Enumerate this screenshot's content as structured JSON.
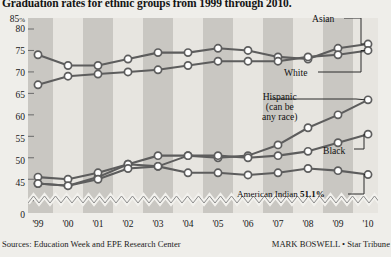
{
  "headline": "Graduation rates for ethnic groups from 1999 through 2010.",
  "footer": {
    "sources": "Sources: Education Week and EPE Research Center",
    "credit": "MARK BOSWELL • Star Tribune"
  },
  "axis": {
    "y_top_label": "85",
    "y_top_suffix": "%",
    "y_ticks": [
      "85",
      "80",
      "75",
      "70",
      "65",
      "60",
      "55",
      "50",
      "45",
      "0"
    ],
    "x_ticks": [
      "'99",
      "'00",
      "'01",
      "'02",
      "'03",
      "'04",
      "'05",
      "'06",
      "'07",
      "'08",
      "'09",
      "'10"
    ]
  },
  "annotations": {
    "asian": "Asian",
    "white": "White",
    "hispanic_line1": "Hispanic",
    "hispanic_line2": "(can be",
    "hispanic_line3": "any race)",
    "black": "Black",
    "american_indian_label": "American Indian",
    "american_indian_value": "51.1%"
  },
  "colors": {
    "background": "#efeeea",
    "band_light": "#e7e5e0",
    "band_dark": "#c9c7c2",
    "line": "#5d5d5d",
    "marker_fill": "#ffffff",
    "text": "#141414"
  },
  "chart_data": {
    "type": "line",
    "title": "Graduation rates for ethnic groups from 1999 through 2010.",
    "xlabel": "",
    "ylabel": "",
    "ylim": [
      44,
      85
    ],
    "grid": false,
    "legend": "inline-annotations",
    "x": [
      "'99",
      "'00",
      "'01",
      "'02",
      "'03",
      "'04",
      "'05",
      "'06",
      "'07",
      "'08",
      "'09",
      "'10"
    ],
    "series": [
      {
        "name": "Asian",
        "x": [
          "'99",
          "'00",
          "'01",
          "'02",
          "'03",
          "'04",
          "'05",
          "'06",
          "'07",
          "'08",
          "'09",
          "'10"
        ],
        "values": [
          79.0,
          76.5,
          76.5,
          78.0,
          79.5,
          79.5,
          80.5,
          80.0,
          78.5,
          78.0,
          80.5,
          81.5
        ]
      },
      {
        "name": "White",
        "x": [
          "'99",
          "'00",
          "'01",
          "'02",
          "'03",
          "'04",
          "'05",
          "'06",
          "'07",
          "'08",
          "'09",
          "'10"
        ],
        "values": [
          72.0,
          74.0,
          74.5,
          75.0,
          75.5,
          76.5,
          77.5,
          77.5,
          77.5,
          78.5,
          79.0,
          80.0
        ]
      },
      {
        "name": "Hispanic (can be any race)",
        "x": [
          "'99",
          "'00",
          "'01",
          "'02",
          "'03",
          "'04",
          "'05",
          "'06",
          "'07",
          "'08",
          "'09",
          "'10"
        ],
        "values": [
          49.0,
          48.5,
          50.5,
          53.5,
          53.0,
          55.5,
          55.0,
          55.5,
          58.0,
          62.0,
          65.0,
          68.5
        ]
      },
      {
        "name": "Black",
        "x": [
          "'99",
          "'00",
          "'01",
          "'02",
          "'03",
          "'04",
          "'05",
          "'06",
          "'07",
          "'08",
          "'09",
          "'10"
        ],
        "values": [
          50.5,
          50.0,
          51.5,
          53.5,
          55.5,
          55.5,
          55.5,
          55.0,
          55.5,
          56.5,
          58.5,
          60.5
        ]
      },
      {
        "name": "American Indian",
        "x": [
          "'99",
          "'00",
          "'01",
          "'02",
          "'03",
          "'04",
          "'05",
          "'06",
          "'07",
          "'08",
          "'09",
          "'10"
        ],
        "values": [
          49.0,
          48.5,
          50.0,
          52.5,
          53.0,
          51.5,
          51.5,
          51.0,
          51.5,
          52.5,
          52.0,
          51.1
        ]
      }
    ]
  }
}
